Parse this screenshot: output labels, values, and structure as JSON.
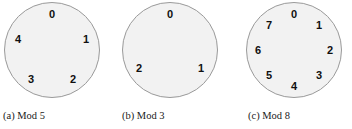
{
  "figure": {
    "background_color": "#ffffff",
    "width": 352,
    "height": 129,
    "dial_fill_color": "#f2f2f2",
    "dial_stroke_color": "#9a9a9a",
    "digit_color": "#101010",
    "caption_color": "#1a1a1a"
  },
  "panels": [
    {
      "key": "mod5",
      "caption": "(a) Mod 5",
      "modulus": 5,
      "center_x": 52,
      "center_y": 50,
      "radius": 48,
      "label_radius": 36,
      "labels": [
        {
          "text": "0",
          "angle_deg": 90,
          "x": 52,
          "y": 14
        },
        {
          "text": "1",
          "angle_deg": 18,
          "x": 86,
          "y": 39
        },
        {
          "text": "2",
          "angle_deg": 306,
          "x": 73,
          "y": 79
        },
        {
          "text": "3",
          "angle_deg": 234,
          "x": 31,
          "y": 79
        },
        {
          "text": "4",
          "angle_deg": 162,
          "x": 18,
          "y": 39
        }
      ]
    },
    {
      "key": "mod3",
      "caption": "(b) Mod 3",
      "modulus": 3,
      "center_x": 170,
      "center_y": 50,
      "radius": 48,
      "label_radius": 36,
      "labels": [
        {
          "text": "0",
          "angle_deg": 90,
          "x": 170,
          "y": 14
        },
        {
          "text": "1",
          "angle_deg": 330,
          "x": 201,
          "y": 68
        },
        {
          "text": "2",
          "angle_deg": 210,
          "x": 139,
          "y": 68
        }
      ]
    },
    {
      "key": "mod8",
      "caption": "(c) Mod 8",
      "modulus": 8,
      "center_x": 294,
      "center_y": 50,
      "radius": 48,
      "label_radius": 36,
      "labels": [
        {
          "text": "0",
          "angle_deg": 90,
          "x": 294,
          "y": 14
        },
        {
          "text": "1",
          "angle_deg": 45,
          "x": 319,
          "y": 25
        },
        {
          "text": "2",
          "angle_deg": 0,
          "x": 330,
          "y": 50
        },
        {
          "text": "3",
          "angle_deg": 315,
          "x": 319,
          "y": 75
        },
        {
          "text": "4",
          "angle_deg": 270,
          "x": 294,
          "y": 86
        },
        {
          "text": "5",
          "angle_deg": 225,
          "x": 269,
          "y": 75
        },
        {
          "text": "6",
          "angle_deg": 180,
          "x": 258,
          "y": 50
        },
        {
          "text": "7",
          "angle_deg": 135,
          "x": 269,
          "y": 25
        }
      ]
    }
  ]
}
